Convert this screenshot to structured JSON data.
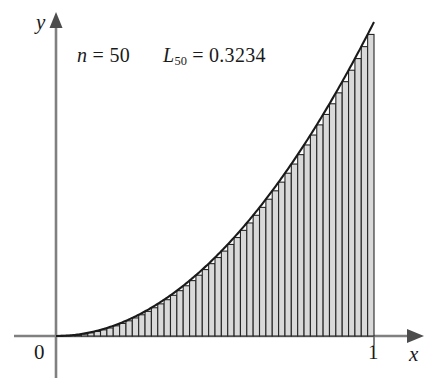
{
  "figure": {
    "title_text": "",
    "annotations": {
      "n_label": "n",
      "n_equals": " = ",
      "n_value": "50",
      "L_label": "L",
      "L_subscript": "50",
      "L_equals": " = ",
      "L_value": "0.3234"
    },
    "axis_labels": {
      "x": "x",
      "y": "y"
    },
    "tick_labels": {
      "origin": "0",
      "x_right": "1"
    },
    "colors": {
      "axis": "#808080",
      "curve": "#1a1a1a",
      "bar_fill": "#d9d9d9",
      "bar_stroke": "#262626",
      "text": "#1a1a1a",
      "background": "#ffffff"
    }
  },
  "chart_data": {
    "type": "bar",
    "title": "",
    "subtitle": "",
    "xlabel": "x",
    "ylabel": "y",
    "xlim": [
      0,
      1
    ],
    "ylim": [
      0,
      1
    ],
    "grid": false,
    "legend": null,
    "legend_position": "none",
    "curve": {
      "name": "y = x^2",
      "function": "x^2",
      "x": [
        0,
        0.05,
        0.1,
        0.15,
        0.2,
        0.25,
        0.3,
        0.35,
        0.4,
        0.45,
        0.5,
        0.55,
        0.6,
        0.65,
        0.7,
        0.75,
        0.8,
        0.85,
        0.9,
        0.95,
        1
      ],
      "y": [
        0,
        0.0025,
        0.01,
        0.0225,
        0.04,
        0.0625,
        0.09,
        0.1225,
        0.16,
        0.2025,
        0.25,
        0.3025,
        0.36,
        0.4225,
        0.49,
        0.5625,
        0.64,
        0.7225,
        0.81,
        0.9025,
        1
      ]
    },
    "rectangles": {
      "n": 50,
      "rule": "left-endpoint",
      "width": 0.02,
      "sum": 0.3234,
      "x_left": [
        0,
        0.02,
        0.04,
        0.06,
        0.08,
        0.1,
        0.12,
        0.14,
        0.16,
        0.18,
        0.2,
        0.22,
        0.24,
        0.26,
        0.28,
        0.3,
        0.32,
        0.34,
        0.36,
        0.38,
        0.4,
        0.42,
        0.44,
        0.46,
        0.48,
        0.5,
        0.52,
        0.54,
        0.56,
        0.58,
        0.6,
        0.62,
        0.64,
        0.66,
        0.68,
        0.7,
        0.72,
        0.74,
        0.76,
        0.78,
        0.8,
        0.82,
        0.84,
        0.86,
        0.88,
        0.9,
        0.92,
        0.94,
        0.96,
        0.98
      ],
      "heights": [
        0,
        0.0004,
        0.0016,
        0.0036,
        0.0064,
        0.01,
        0.0144,
        0.0196,
        0.0256,
        0.0324,
        0.04,
        0.0484,
        0.0576,
        0.0676,
        0.0784,
        0.09,
        0.1024,
        0.1156,
        0.1296,
        0.1444,
        0.16,
        0.1764,
        0.1936,
        0.2116,
        0.2304,
        0.25,
        0.2704,
        0.2916,
        0.3136,
        0.3364,
        0.36,
        0.3844,
        0.4096,
        0.4356,
        0.4624,
        0.49,
        0.5184,
        0.5476,
        0.5776,
        0.6084,
        0.64,
        0.6724,
        0.7056,
        0.7396,
        0.7744,
        0.81,
        0.8464,
        0.8836,
        0.9216,
        0.9604
      ]
    },
    "annotations": [
      {
        "text": "n = 50",
        "x": 0.07,
        "y": 0.93
      },
      {
        "text": "L_50 = 0.3234",
        "x": 0.34,
        "y": 0.93
      }
    ]
  }
}
